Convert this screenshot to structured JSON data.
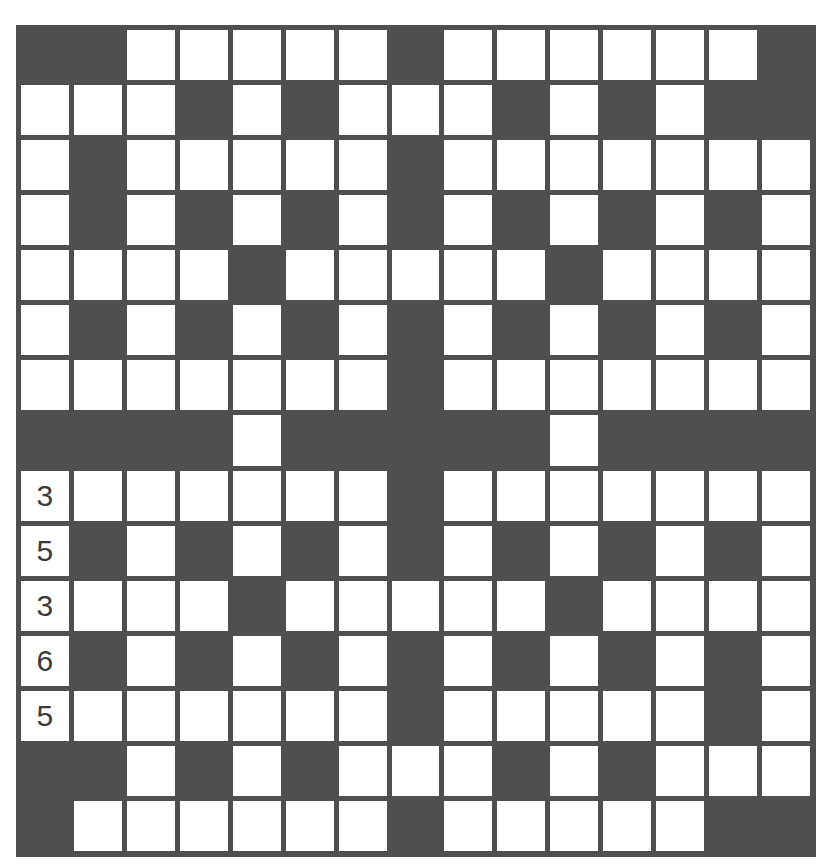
{
  "puzzle": {
    "rows": 15,
    "cols": 15,
    "colors": {
      "block": "#4f4f4f",
      "cell": "#ffffff",
      "number": "#3a3a3a"
    },
    "layout": [
      "BBWWWWWBWWWWWWB",
      "WWWBWBWWWBWBWBB",
      "WBWWWWWBWWWWWWW",
      "WBWBWBWBWBWBWBW",
      "WWWWBWWWWWBWWWW",
      "WBWBWBWBWBWBWBW",
      "WWWWWWWBWWWWWWW",
      "BBBBWBBBBBWBBBB",
      "WWWWWWWBWWWWWWW",
      "WBWBWBWBWBWBWBW",
      "WWWWBWWWWWBWWWW",
      "WBWBWBWBWBWBWBW",
      "WWWWWWWBWWWWWBW",
      "BBWBWBWWWBWBWWW",
      "BWWWWWWBWWWWWBB"
    ],
    "given_numbers": [
      {
        "row": 8,
        "col": 0,
        "value": "3"
      },
      {
        "row": 9,
        "col": 0,
        "value": "5"
      },
      {
        "row": 10,
        "col": 0,
        "value": "3"
      },
      {
        "row": 11,
        "col": 0,
        "value": "6"
      },
      {
        "row": 12,
        "col": 0,
        "value": "5"
      }
    ]
  }
}
